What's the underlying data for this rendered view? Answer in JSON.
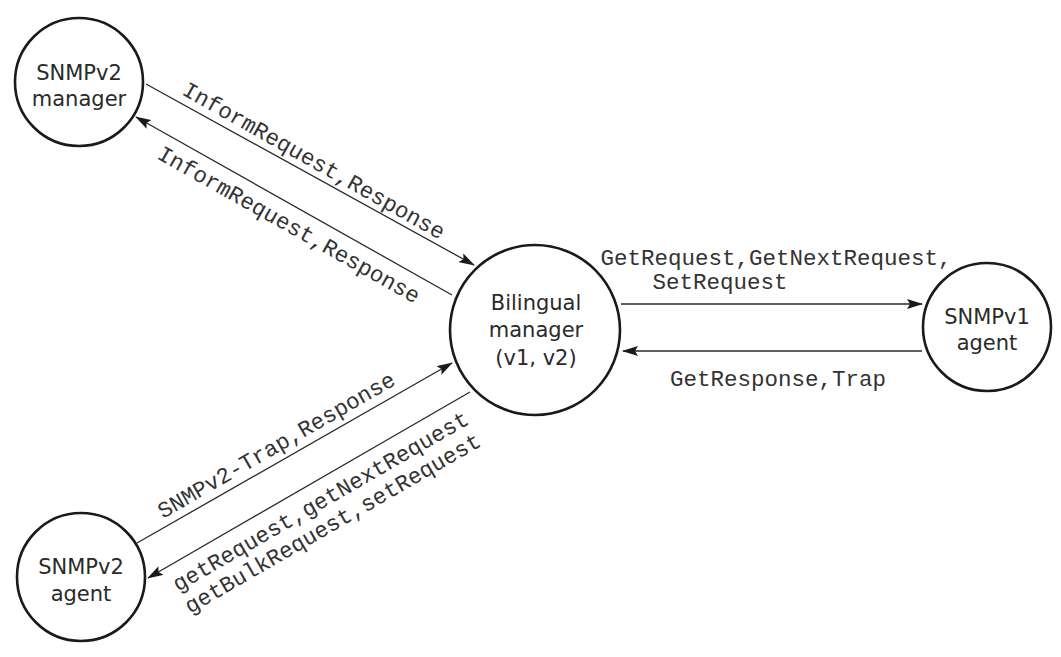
{
  "diagram": {
    "type": "SNMP bilingual manager message flow",
    "nodes": {
      "snmpv2_manager": {
        "line1": "SNMPv2",
        "line2": "manager"
      },
      "bilingual_manager": {
        "line1": "Bilingual",
        "line2": "manager",
        "line3": "(v1, v2)"
      },
      "snmpv1_agent": {
        "line1": "SNMPv1",
        "line2": "agent"
      },
      "snmpv2_agent": {
        "line1": "SNMPv2",
        "line2": "agent"
      }
    },
    "edges": {
      "v2mgr_to_bilingual": {
        "from": "SNMPv2 manager",
        "to": "Bilingual manager",
        "label": "InformRequest,Response"
      },
      "bilingual_to_v2mgr": {
        "from": "Bilingual manager",
        "to": "SNMPv2 manager",
        "label": "InformRequest,Response"
      },
      "bilingual_to_v1agent": {
        "from": "Bilingual manager",
        "to": "SNMPv1 agent",
        "label_line1": "GetRequest,GetNextRequest,",
        "label_line2": "SetRequest"
      },
      "v1agent_to_bilingual": {
        "from": "SNMPv1 agent",
        "to": "Bilingual manager",
        "label": "GetResponse,Trap"
      },
      "v2agent_to_bilingual": {
        "from": "SNMPv2 agent",
        "to": "Bilingual manager",
        "label": "SNMPv2-Trap,Response"
      },
      "bilingual_to_v2agent": {
        "from": "Bilingual manager",
        "to": "SNMPv2 agent",
        "label_line1": "getRequest,getNextRequest",
        "label_line2": "getBulkRequest,setRequest"
      }
    },
    "colors": {
      "background": "#ffffff",
      "stroke": "#1a1a1a",
      "text": "#2a2a2a"
    }
  }
}
